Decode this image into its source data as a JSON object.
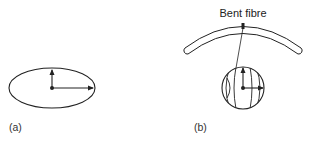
{
  "figure": {
    "panel_a": {
      "label": "(a)",
      "shape": "ellipse",
      "arrows": [
        "up",
        "right"
      ]
    },
    "panel_b": {
      "label": "(b)",
      "title": "Bent fibre",
      "shape": "bent-fibre-with-magnified-circle",
      "arrows": [
        "up",
        "right"
      ]
    },
    "colors": {
      "stroke": "#222222",
      "background": "#ffffff"
    }
  }
}
